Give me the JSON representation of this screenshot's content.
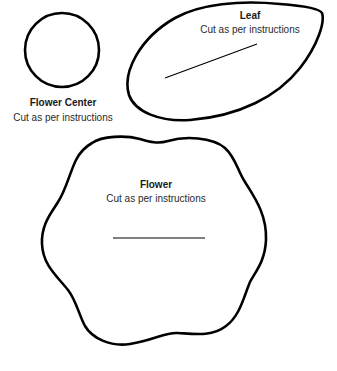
{
  "pieces": {
    "flower_center": {
      "title": "Flower Center",
      "subtitle": "Cut as per instructions",
      "shape": "circle"
    },
    "leaf": {
      "title": "Leaf",
      "subtitle": "Cut as per instructions",
      "shape": "leaf"
    },
    "flower": {
      "title": "Flower",
      "subtitle": "Cut as per instructions",
      "shape": "six-lobed flower"
    }
  },
  "colors": {
    "outline": "#000000",
    "background": "#ffffff"
  }
}
